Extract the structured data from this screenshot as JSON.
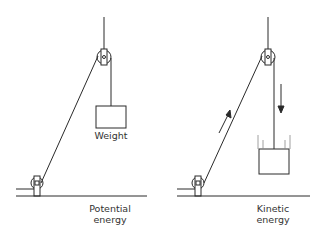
{
  "diagram": {
    "left": {
      "weight_label": "Weight",
      "energy_label_line1": "Potential",
      "energy_label_line2": "energy"
    },
    "right": {
      "energy_label_line1": "Kinetic",
      "energy_label_line2": "energy"
    },
    "colors": {
      "line": "#2a2a2a",
      "background": "#ffffff"
    }
  }
}
